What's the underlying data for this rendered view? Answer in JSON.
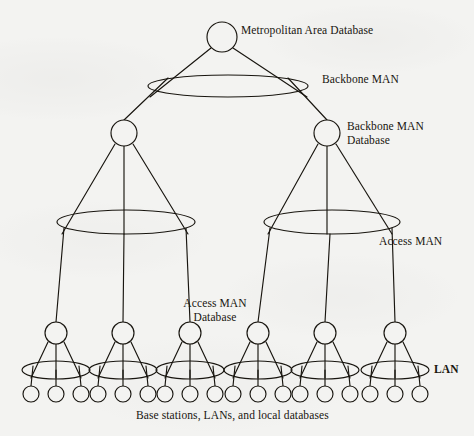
{
  "figure": {
    "background_color": "#f3f3f1",
    "ink_color": "#18150f",
    "caption": "Base stations, LANs, and local databases"
  },
  "labels": {
    "root": "Metropolitan Area Database",
    "backbone_man": "Backbone MAN",
    "backbone_man_database_line1": "Backbone MAN",
    "backbone_man_database_line2": "Database",
    "access_man": "Access MAN",
    "access_man_database_line1": "Access MAN",
    "access_man_database_line2": "Database",
    "lan": "LAN",
    "bottom_caption": "Base stations, LANs, and local databases"
  },
  "topology": {
    "tiers": [
      {
        "name": "metropolitan-area-database",
        "level": 0,
        "node_count": 1,
        "node_radius": 15,
        "nodes": [
          {
            "id": "root",
            "cx": 222,
            "cy": 37
          }
        ]
      },
      {
        "name": "backbone-man-ring",
        "level": 1,
        "type": "bus-ellipse",
        "ellipses": [
          {
            "id": "backbone-man",
            "cx": 228,
            "cy": 86,
            "rx": 80,
            "ry": 11
          }
        ]
      },
      {
        "name": "backbone-man-database",
        "level": 2,
        "node_count": 2,
        "node_radius": 13,
        "nodes": [
          {
            "id": "bb-left",
            "cx": 124,
            "cy": 133
          },
          {
            "id": "bb-right",
            "cx": 327,
            "cy": 133
          }
        ]
      },
      {
        "name": "access-man-rings",
        "level": 3,
        "type": "bus-ellipse",
        "ellipses": [
          {
            "id": "access-man-left",
            "cx": 126,
            "cy": 222,
            "rx": 69,
            "ry": 12
          },
          {
            "id": "access-man-right",
            "cx": 332,
            "cy": 222,
            "rx": 68,
            "ry": 12
          }
        ]
      },
      {
        "name": "access-man-database",
        "level": 4,
        "node_count": 6,
        "node_radius": 11,
        "nodes": [
          {
            "id": "bs-1",
            "cx": 56,
            "cy": 333
          },
          {
            "id": "bs-2",
            "cx": 123,
            "cy": 333
          },
          {
            "id": "bs-3",
            "cx": 190,
            "cy": 333
          },
          {
            "id": "bs-4",
            "cx": 258,
            "cy": 333
          },
          {
            "id": "bs-5",
            "cx": 325,
            "cy": 333
          },
          {
            "id": "bs-6",
            "cx": 395,
            "cy": 333
          }
        ]
      },
      {
        "name": "lan-rings",
        "level": 5,
        "type": "bus-ellipse",
        "ellipse_rx": 34,
        "ellipse_ry": 9,
        "ellipse_cy": 370,
        "ellipses": [
          {
            "id": "lan-1",
            "cx": 56
          },
          {
            "id": "lan-2",
            "cx": 123
          },
          {
            "id": "lan-3",
            "cx": 190
          },
          {
            "id": "lan-4",
            "cx": 258
          },
          {
            "id": "lan-5",
            "cx": 325
          },
          {
            "id": "lan-6",
            "cx": 395
          }
        ]
      },
      {
        "name": "local-databases",
        "level": 6,
        "node_count": 18,
        "node_radius": 8,
        "leaf_cy": 394,
        "leaf_offsets": [
          -25,
          0,
          25
        ]
      }
    ],
    "edges": [
      {
        "from": "root",
        "to": "backbone-man-left-attach"
      },
      {
        "from": "root",
        "to": "backbone-man-right-attach"
      },
      {
        "from": "backbone-man",
        "to": "bb-left"
      },
      {
        "from": "backbone-man",
        "to": "bb-right"
      },
      {
        "from": "bb-left",
        "to": "access-man-left",
        "fanout": 3
      },
      {
        "from": "bb-right",
        "to": "access-man-right",
        "fanout": 3
      },
      {
        "from": "access-man-left",
        "to": "bs-1"
      },
      {
        "from": "access-man-left",
        "to": "bs-2"
      },
      {
        "from": "access-man-left",
        "to": "bs-3"
      },
      {
        "from": "access-man-right",
        "to": "bs-4"
      },
      {
        "from": "access-man-right",
        "to": "bs-5"
      },
      {
        "from": "access-man-right",
        "to": "bs-6"
      },
      {
        "from": "base-station",
        "to": "lan-ring",
        "fanout": 3
      },
      {
        "from": "lan-ring",
        "to": "local-database",
        "fanout": 3
      }
    ]
  },
  "label_positions": {
    "root": {
      "x": 242,
      "y": 30
    },
    "backbone_man": {
      "x": 322,
      "y": 79
    },
    "backbone_man_database": {
      "x": 348,
      "y": 126
    },
    "access_man": {
      "x": 380,
      "y": 240
    },
    "access_man_database": {
      "x": 174,
      "y": 303
    },
    "lan": {
      "x": 436,
      "y": 363
    },
    "bottom_caption": {
      "x": 140,
      "y": 412
    }
  }
}
